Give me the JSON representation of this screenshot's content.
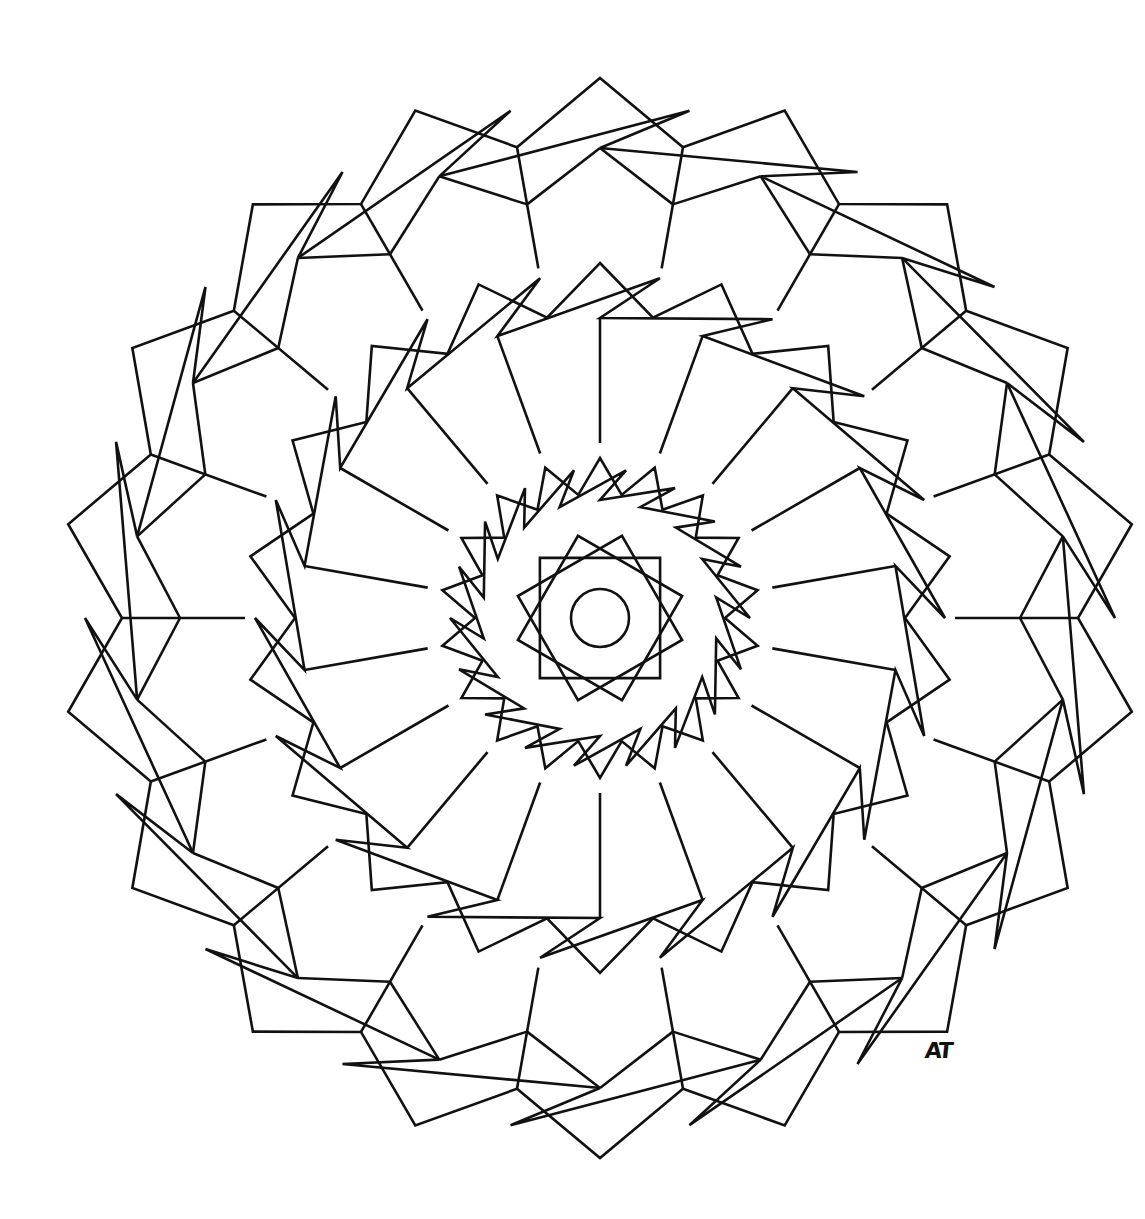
{
  "artwork": {
    "type": "mandala-line-art",
    "stroke_color": "#111111",
    "background": "#ffffff",
    "center": [
      600,
      618
    ],
    "symmetry_order": 18
  },
  "signature": {
    "text": "AT"
  }
}
